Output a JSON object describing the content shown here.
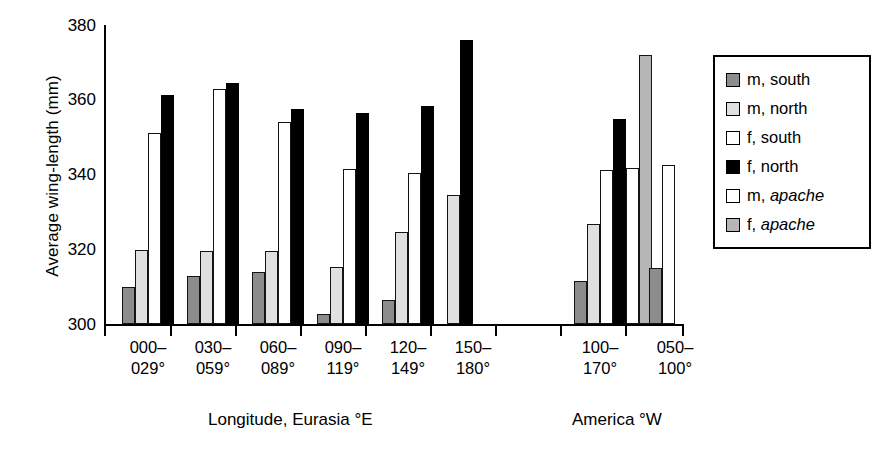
{
  "chart_data": {
    "type": "bar",
    "title": "",
    "xlabel": "Longitude, Eurasia °E",
    "xlabel2": "America °W",
    "ylabel": "Average wing-length (mm)",
    "ylim": [
      300,
      380
    ],
    "yticks": [
      300,
      320,
      340,
      360,
      380
    ],
    "grid": false,
    "legend_position": "right",
    "categories": [
      "000–\n029°",
      "030–\n059°",
      "060–\n089°",
      "090–\n119°",
      "120–\n149°",
      "150–\n180°",
      "100–\n170°",
      "050–\n100°"
    ],
    "category_lines": [
      [
        "000–",
        "029°"
      ],
      [
        "030–",
        "059°"
      ],
      [
        "060–",
        "089°"
      ],
      [
        "090–",
        "119°"
      ],
      [
        "120–",
        "149°"
      ],
      [
        "150–",
        "180°"
      ],
      [
        "100–",
        "170°"
      ],
      [
        "050–",
        "100°"
      ]
    ],
    "series": [
      {
        "name": "m, south",
        "key": "msouth",
        "color": "#8c8c8c",
        "values": [
          310.0,
          312.8,
          314.0,
          302.8,
          306.4,
          null,
          311.5,
          315.0
        ]
      },
      {
        "name": "m, north",
        "key": "mnorth",
        "color": "#e0e0e0",
        "values": [
          319.8,
          319.5,
          319.5,
          315.2,
          324.5,
          334.5,
          326.8,
          null
        ]
      },
      {
        "name": "f, south",
        "key": "fsouth",
        "color": "#ffffff",
        "values": [
          351.0,
          362.8,
          354.0,
          341.5,
          340.5,
          null,
          341.3,
          null
        ]
      },
      {
        "name": "f, north",
        "key": "fnorth",
        "color": "#000000",
        "values": [
          361.3,
          364.5,
          357.5,
          356.5,
          358.2,
          376.0,
          354.8,
          null
        ]
      },
      {
        "name": "m, apache",
        "key": "mapache",
        "color": "#ffffff",
        "values": [
          null,
          null,
          null,
          null,
          null,
          null,
          341.8,
          342.5
        ]
      },
      {
        "name": "f, apache",
        "key": "fapache",
        "color": "#b5b5b5",
        "values": [
          null,
          null,
          null,
          null,
          null,
          null,
          372.0,
          null
        ]
      }
    ]
  },
  "legend": {
    "items": [
      {
        "label_plain": "m, ",
        "label_italic": "south",
        "swatch_class": "sw-msouth",
        "name": "legend-item-m-south"
      },
      {
        "label_plain": "m, ",
        "label_italic": "north",
        "swatch_class": "sw-mnorth",
        "name": "legend-item-m-north"
      },
      {
        "label_plain": "f, ",
        "label_italic": "south",
        "swatch_class": "sw-fsouth",
        "name": "legend-item-f-south"
      },
      {
        "label_plain": "f, ",
        "label_italic": "north",
        "swatch_class": "sw-fnorth",
        "name": "legend-item-f-north"
      },
      {
        "label_plain": "m, ",
        "label_italic": "apache",
        "swatch_class": "sw-mapache",
        "name": "legend-item-m-apache"
      },
      {
        "label_plain": "f, ",
        "label_italic": "apache",
        "swatch_class": "sw-fapache",
        "name": "legend-item-f-apache"
      }
    ],
    "italic_entries": [
      "m, apache",
      "f, apache"
    ],
    "entry_labels": [
      "m, south",
      "m, north",
      "f, south",
      "f, north",
      "m, apache",
      "f, apache"
    ]
  },
  "axis": {
    "y_tick_labels": [
      "380",
      "360",
      "340",
      "320",
      "300"
    ],
    "y_title": "Average wing-length (mm)",
    "x_caption_eurasia": "Longitude, Eurasia °E",
    "x_caption_america": "America °W"
  }
}
